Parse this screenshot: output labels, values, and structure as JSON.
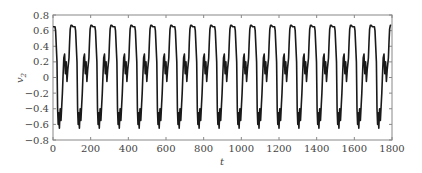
{
  "chart_data": {
    "type": "line",
    "title": "",
    "xlabel": "t",
    "ylabel": "v2",
    "ylabel_base": "v",
    "ylabel_sub": "2",
    "xlim": [
      0,
      1800
    ],
    "ylim": [
      -0.8,
      0.8
    ],
    "xticks": [
      0,
      200,
      400,
      600,
      800,
      1000,
      1200,
      1400,
      1600,
      1800
    ],
    "yticks": [
      0.8,
      0.6,
      0.4,
      0.2,
      0,
      -0.2,
      -0.4,
      -0.6,
      -0.8
    ],
    "ytick_labels": [
      "0.8",
      "0.6",
      "0.4",
      "0.2",
      "0",
      "−0.2",
      "−0.4",
      "−0.6",
      "−0.8"
    ],
    "grid": false,
    "legend": null,
    "series": [
      {
        "name": "v2",
        "color": "#1a1a1a",
        "period": 106,
        "phase": 0,
        "cycle_shape": {
          "t_frac": [
            0.0,
            0.1,
            0.13,
            0.2,
            0.23,
            0.26,
            0.29,
            0.32,
            0.36,
            0.4,
            0.44,
            0.47,
            0.5,
            0.54,
            0.58,
            0.62,
            0.66,
            0.7,
            0.74,
            0.8,
            0.83,
            0.86,
            0.9,
            0.94,
            1.0
          ],
          "v": [
            0.65,
            0.65,
            0.6,
            0.2,
            -0.4,
            -0.6,
            -0.45,
            -0.65,
            -0.4,
            -0.55,
            -0.35,
            -0.2,
            0.0,
            0.25,
            0.3,
            0.05,
            0.2,
            -0.05,
            0.1,
            0.25,
            0.45,
            0.62,
            0.67,
            0.67,
            0.65
          ]
        },
        "range": {
          "min": -0.67,
          "max": 0.67
        },
        "approx_cycles": 17
      }
    ]
  }
}
